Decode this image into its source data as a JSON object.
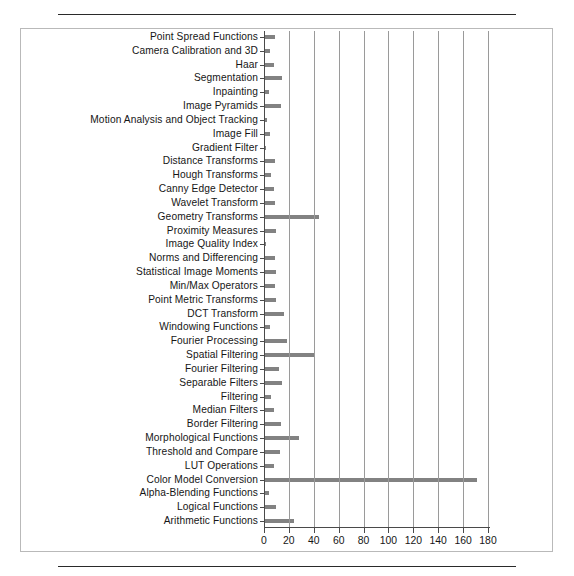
{
  "figure": {
    "panel_border_color": "#b9b9b9",
    "rule_color": "#2a2a2a"
  },
  "chart_data": {
    "type": "bar",
    "orientation": "horizontal",
    "title": "",
    "xlabel": "",
    "ylabel": "",
    "xlim": [
      0,
      180
    ],
    "xticks": [
      0,
      20,
      40,
      60,
      80,
      100,
      120,
      140,
      160,
      180
    ],
    "xtick_labels": [
      "0",
      "20",
      "40",
      "60",
      "80",
      "100",
      "120",
      "140",
      "160",
      "180"
    ],
    "grid": "vertical",
    "legend": "none",
    "bar_color": "#828282",
    "axis_color": "#4a4a4a",
    "categories": [
      "Point Spread Functions",
      "Camera Calibration and 3D",
      "Haar",
      "Segmentation",
      "Inpainting",
      "Image Pyramids",
      "Motion Analysis and Object Tracking",
      "Image Fill",
      "Gradient Filter",
      "Distance Transforms",
      "Hough Transforms",
      "Canny Edge Detector",
      "Wavelet Transform",
      "Geometry Transforms",
      "Proximity Measures",
      "Image Quality Index",
      "Norms and Differencing",
      "Statistical Image Moments",
      "Min/Max Operators",
      "Point Metric Transforms",
      "DCT Transform",
      "Windowing Functions",
      "Fourier Processing",
      "Spatial Filtering",
      "Fourier Filtering",
      "Separable Filters",
      "Filtering",
      "Median Filters",
      "Border Filtering",
      "Morphological Functions",
      "Threshold and Compare",
      "LUT Operations",
      "Color Model Conversion",
      "Alpha-Blending Functions",
      "Logical Functions",
      "Arithmetic Functions"
    ],
    "values": [
      8,
      4,
      7,
      14,
      3,
      13,
      2,
      4,
      1,
      8,
      5,
      7,
      8,
      43,
      9,
      1,
      8,
      9,
      8,
      9,
      15,
      4,
      18,
      40,
      11,
      14,
      5,
      7,
      13,
      27,
      12,
      7,
      170,
      3,
      9,
      23
    ]
  }
}
